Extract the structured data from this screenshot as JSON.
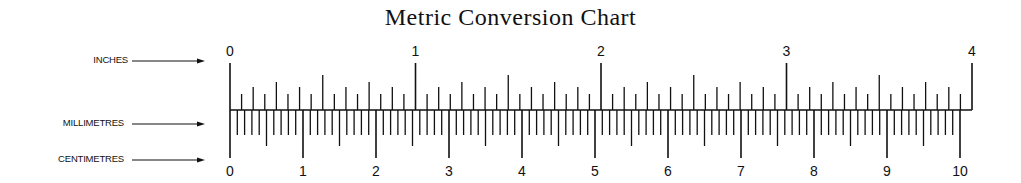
{
  "title": "Metric Conversion Chart",
  "rows": [
    {
      "label": "INCHES",
      "y": 61
    },
    {
      "label": "MILLIMETRES",
      "y": 124
    },
    {
      "label": "CENTIMETRES",
      "y": 160
    }
  ],
  "inch_scale": {
    "labels": [
      "0",
      "1",
      "2",
      "3",
      "4"
    ],
    "subdivisions_per_inch": 16
  },
  "cm_scale": {
    "labels": [
      "0",
      "1",
      "2",
      "3",
      "4",
      "5",
      "6",
      "7",
      "8",
      "9",
      "10"
    ],
    "mm_per_cm": 10
  },
  "colors": {
    "ink": "#111111",
    "background": "#ffffff"
  }
}
